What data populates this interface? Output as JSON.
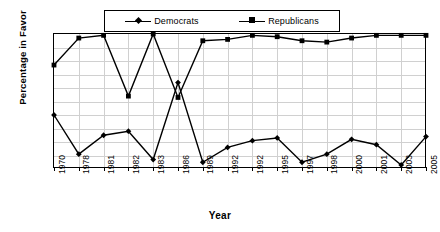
{
  "chart_data": {
    "type": "line",
    "title": "",
    "xlabel": "Year",
    "ylabel": "Percentage in Favor",
    "categories": [
      "1970",
      "1978",
      "1981",
      "1982",
      "1983",
      "1986",
      "1989",
      "1992",
      "1992",
      "1995",
      "1997",
      "1998",
      "2000",
      "2001",
      "2003",
      "2005"
    ],
    "series": [
      {
        "name": "Democrats",
        "marker": "diamond",
        "color": "#000000",
        "values": [
          40,
          11,
          25,
          28,
          7,
          64,
          5,
          16,
          21,
          23,
          5,
          11,
          22,
          18,
          3,
          24
        ]
      },
      {
        "name": "Republicans",
        "marker": "square",
        "color": "#000000",
        "values": [
          77,
          97,
          99,
          54,
          100,
          53,
          95,
          96,
          99,
          98,
          95,
          94,
          97,
          99,
          99,
          99
        ]
      }
    ],
    "ylim": [
      0,
      100
    ],
    "yticks": [
      0,
      10,
      20,
      30,
      40,
      50,
      60,
      70,
      80,
      90,
      100
    ],
    "ytick_labels": [
      "0",
      "10",
      "20",
      "30",
      "40",
      "50",
      "60",
      "70",
      "80",
      "90",
      "100"
    ],
    "grid": true,
    "legend_position": "top"
  },
  "legend": {
    "entries": [
      {
        "label": "Democrats"
      },
      {
        "label": "Republicans"
      }
    ]
  },
  "axes": {
    "y_title": "Percentage in Favor",
    "x_title": "Year"
  }
}
